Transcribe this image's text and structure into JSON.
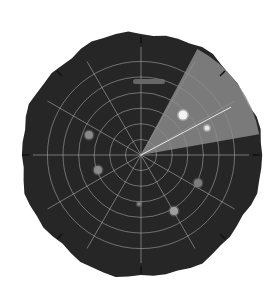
{
  "image": {
    "width": 277,
    "height": 304,
    "background": "#ffffff"
  },
  "radar": {
    "center": [
      141,
      155
    ],
    "radius": 120,
    "disc_color": "#262626",
    "grid_color": "#bdbdbd",
    "ring_count": 6,
    "spoke_angles_deg": [
      0,
      30,
      60,
      90,
      120,
      150,
      180,
      210,
      240,
      270,
      300,
      330
    ],
    "sweep": {
      "start_deg": -62,
      "end_deg": -10,
      "color": "#8e8e8e",
      "opacity": 0.82,
      "leading_line_deg": -28
    },
    "edge_ticks_deg": [
      0,
      90,
      180,
      270,
      45,
      135,
      225,
      315
    ],
    "blips": [
      {
        "id": "blip-1",
        "x": 183,
        "y": 115,
        "r": 4.5,
        "color": "#f2f2f2"
      },
      {
        "id": "blip-2",
        "x": 207,
        "y": 128,
        "r": 2.5,
        "color": "#e6e6e6"
      },
      {
        "id": "blip-3",
        "x": 89,
        "y": 135,
        "r": 4,
        "color": "#8a8a8a"
      },
      {
        "id": "blip-4",
        "x": 98,
        "y": 170,
        "r": 4,
        "color": "#8a8a8a"
      },
      {
        "id": "blip-5",
        "x": 198,
        "y": 183,
        "r": 4,
        "color": "#7c7c7c"
      },
      {
        "id": "blip-6",
        "x": 174,
        "y": 211,
        "r": 4,
        "color": "#a0a0a0"
      },
      {
        "id": "blip-7",
        "x": 139,
        "y": 204,
        "r": 1.8,
        "color": "#8a8a8a"
      }
    ],
    "streak": {
      "x": 133,
      "y": 79,
      "width": 32,
      "height": 5,
      "color": "#6e6e6e"
    }
  }
}
